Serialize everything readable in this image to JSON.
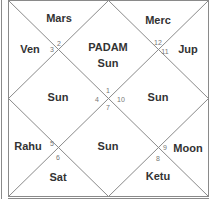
{
  "chart": {
    "style": "North Indian Kundli",
    "colors": {
      "line": "#8a8a8a",
      "text": "#333333",
      "house_number": "#777777",
      "background": "#ffffff"
    },
    "center_label": "PADAM",
    "houses": [
      {
        "number": "1",
        "planets": "Sun"
      },
      {
        "number": "2",
        "planets": "Mars"
      },
      {
        "number": "3",
        "planets": "Ven"
      },
      {
        "number": "4",
        "planets": "Sun"
      },
      {
        "number": "5",
        "planets": "Rahu"
      },
      {
        "number": "6",
        "planets": "Sat"
      },
      {
        "number": "7",
        "planets": "Sun"
      },
      {
        "number": "8",
        "planets": "Ketu"
      },
      {
        "number": "9",
        "planets": "Moon"
      },
      {
        "number": "10",
        "planets": "Sun"
      },
      {
        "number": "11",
        "planets": "Jup"
      },
      {
        "number": "12",
        "planets": "Merc"
      }
    ]
  }
}
